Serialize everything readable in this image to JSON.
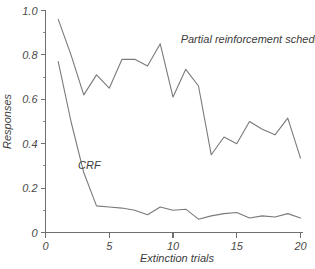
{
  "chart_data": {
    "type": "line",
    "title": "",
    "xlabel": "Extinction trials",
    "ylabel": "Responses",
    "xlim": [
      0,
      20
    ],
    "ylim": [
      0,
      1.0
    ],
    "grid": false,
    "legend_position": "inline-annotation",
    "x": [
      1,
      2,
      3,
      4,
      5,
      6,
      7,
      8,
      9,
      10,
      11,
      12,
      13,
      14,
      15,
      16,
      17,
      18,
      19,
      20
    ],
    "xticks": [
      0,
      5,
      10,
      15,
      20
    ],
    "xtick_labels": [
      "0",
      "5",
      "10",
      "15",
      "20"
    ],
    "yticks": [
      0,
      0.2,
      0.4,
      0.6,
      0.8,
      1.0
    ],
    "ytick_labels": [
      "0",
      "0.2",
      "0.4",
      "0.6",
      "0.8",
      "1.0"
    ],
    "yticks_minor": [
      0.1,
      0.3,
      0.5,
      0.7,
      0.9
    ],
    "series": [
      {
        "name": "Partial reinforcement schedule",
        "label_x": 10.6,
        "label_y": 0.855,
        "values": [
          0.96,
          0.8,
          0.62,
          0.71,
          0.65,
          0.78,
          0.78,
          0.75,
          0.85,
          0.61,
          0.735,
          0.66,
          0.35,
          0.43,
          0.4,
          0.5,
          0.465,
          0.44,
          0.515,
          0.335
        ]
      },
      {
        "name": "CRF",
        "label_x": 2.55,
        "label_y": 0.285,
        "values": [
          0.77,
          0.5,
          0.27,
          0.12,
          0.115,
          0.11,
          0.1,
          0.08,
          0.115,
          0.1,
          0.105,
          0.06,
          0.075,
          0.085,
          0.09,
          0.065,
          0.075,
          0.07,
          0.085,
          0.065
        ]
      }
    ]
  },
  "colors": {
    "line": "#7a7a7a",
    "axis": "#6f6f6f",
    "text": "#3c3c3c",
    "background": "#ffffff"
  }
}
